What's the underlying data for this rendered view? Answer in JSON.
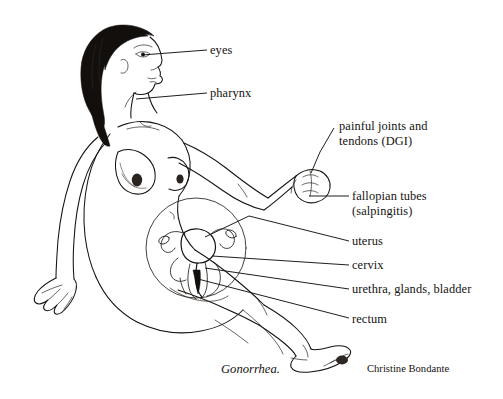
{
  "figure": {
    "title": "Gonorrhea.",
    "credit": "Christine Bondante",
    "ink_color": "#15120f",
    "background_color": "#ffffff"
  },
  "labels": [
    {
      "id": "eyes",
      "text": "eyes",
      "x": 210,
      "y": 44
    },
    {
      "id": "pharynx",
      "text": "pharynx",
      "x": 210,
      "y": 87
    },
    {
      "id": "dgi_line1",
      "text": "painful joints and",
      "x": 339,
      "y": 120
    },
    {
      "id": "dgi_line2",
      "text": "tendons (DGI)",
      "x": 339,
      "y": 135
    },
    {
      "id": "fallopian_line1",
      "text": "fallopian tubes",
      "x": 352,
      "y": 190
    },
    {
      "id": "fallopian_line2",
      "text": "(salpingitis)",
      "x": 352,
      "y": 205
    },
    {
      "id": "uterus",
      "text": "uterus",
      "x": 352,
      "y": 235
    },
    {
      "id": "cervix",
      "text": "cervix",
      "x": 352,
      "y": 259
    },
    {
      "id": "urethra",
      "text": "urethra, glands, bladder",
      "x": 352,
      "y": 283
    },
    {
      "id": "rectum",
      "text": "rectum",
      "x": 352,
      "y": 313
    }
  ],
  "leader_lines": [
    {
      "id": "eyes-leader",
      "points": "142,55 207,50"
    },
    {
      "id": "pharynx-leader",
      "points": "136,99 207,93"
    },
    {
      "id": "dgi-leader",
      "points": "334,128 320,152 311,173"
    },
    {
      "id": "fallopian-leader",
      "points": "311,196 349,196"
    },
    {
      "id": "uterus-leader",
      "points": "205,237 249,216 349,241"
    },
    {
      "id": "cervix-leader",
      "points": "212,256 349,265"
    },
    {
      "id": "urethra-leader",
      "points": "205,268 349,289"
    },
    {
      "id": "rectum-leader",
      "points": "198,279 349,318"
    }
  ],
  "icon_names": {
    "figure": "seated-female-figure-icon",
    "inset": "pelvic-anatomy-inset-icon"
  }
}
